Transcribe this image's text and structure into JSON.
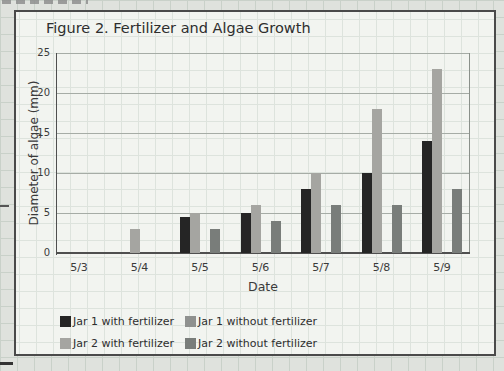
{
  "chart": {
    "title": "Figure 2. Fertilizer and Algae Growth",
    "x_axis": {
      "label": "Date",
      "ticks": [
        "5/3",
        "5/4",
        "5/5",
        "5/6",
        "5/7",
        "5/8",
        "5/9"
      ]
    },
    "y_axis": {
      "label": "Diameter of algae (mm)",
      "ticks": [
        0,
        5,
        10,
        15,
        20,
        25
      ]
    }
  },
  "chart_data": {
    "type": "bar",
    "title": "Figure 2. Fertilizer and Algae Growth",
    "xlabel": "Date",
    "ylabel": "Diameter of algae (mm)",
    "categories": [
      "5/3",
      "5/4",
      "5/5",
      "5/6",
      "5/7",
      "5/8",
      "5/9"
    ],
    "series": [
      {
        "name": "Jar 1 with fertilizer",
        "color": "#252525",
        "slot": 0,
        "values": [
          0,
          0,
          4.5,
          5,
          8,
          10,
          14
        ]
      },
      {
        "name": "Jar 1 without fertilizer",
        "color": "#8f918f",
        "slot": 2,
        "values": [
          0,
          0,
          0,
          0,
          0,
          0,
          0
        ]
      },
      {
        "name": "Jar 2 with fertilizer",
        "color": "#a5a5a1",
        "slot": 1,
        "values": [
          0,
          3,
          5,
          6,
          10,
          18,
          23
        ]
      },
      {
        "name": "Jar 2 without fertilizer",
        "color": "#797d7a",
        "slot": 3,
        "values": [
          0,
          0,
          3,
          4,
          6,
          6,
          8
        ]
      }
    ],
    "ylim": [
      0,
      25
    ],
    "y_ticks": [
      0,
      5,
      10,
      15,
      20,
      25
    ],
    "grid": true,
    "legend_position": "bottom"
  }
}
